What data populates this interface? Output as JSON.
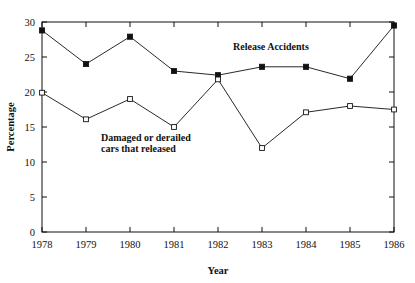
{
  "chart_data": {
    "type": "line",
    "title": "",
    "xlabel": "Year",
    "ylabel": "Percentage",
    "categories": [
      "1978",
      "1979",
      "1980",
      "1981",
      "1982",
      "1983",
      "1984",
      "1985",
      "1986"
    ],
    "x": [
      1978,
      1979,
      1980,
      1981,
      1982,
      1983,
      1984,
      1985,
      1986
    ],
    "xlim": [
      1978,
      1986
    ],
    "ylim": [
      0,
      30
    ],
    "ytick_labels": [
      "0",
      "5",
      "10",
      "15",
      "20",
      "25",
      "30"
    ],
    "ytick_values": [
      0,
      5,
      10,
      15,
      20,
      25,
      30
    ],
    "grid": false,
    "legend_position": "inline-annotation",
    "series": [
      {
        "name": "Release Accidents",
        "marker": "filled-square",
        "values": [
          28.8,
          24.0,
          27.9,
          23.0,
          22.4,
          23.6,
          23.6,
          21.9,
          29.5
        ]
      },
      {
        "name": "Damaged or derailed cars that released",
        "marker": "open-square",
        "values": [
          19.9,
          16.1,
          19.0,
          15.0,
          21.8,
          12.0,
          17.1,
          18.0,
          17.5
        ]
      }
    ],
    "annotations": [
      {
        "id": "release-accidents-label",
        "text": "Release Accidents",
        "x": 233,
        "y": 50
      },
      {
        "id": "damaged-derailed-label-line1",
        "text": "Damaged or derailed",
        "x": 101,
        "y": 141
      },
      {
        "id": "damaged-derailed-label-line2",
        "text": "cars that released",
        "x": 101,
        "y": 152
      }
    ],
    "colors": {
      "axis": "#111111",
      "series_line": "#111111",
      "marker_fill": "#111111",
      "marker_open_fill": "#ffffff",
      "background": "#ffffff"
    }
  }
}
